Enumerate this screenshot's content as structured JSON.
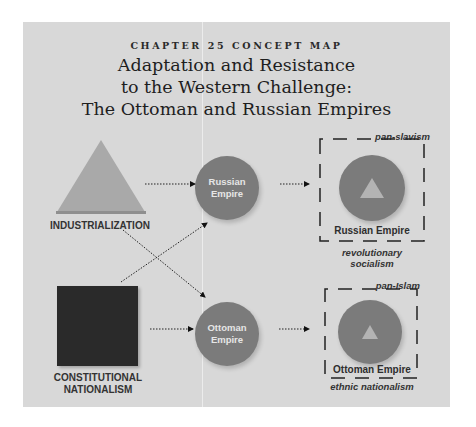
{
  "header": {
    "kicker": "CHAPTER 25 CONCEPT MAP",
    "title_lines": [
      "Adaptation and Resistance",
      "to the Western Challenge:",
      "The Ottoman and Russian Empires"
    ]
  },
  "sources": [
    {
      "id": "industrialization",
      "label": "INDUSTRIALIZATION",
      "shape": "triangle",
      "color": "#a9a9a9"
    },
    {
      "id": "constitutional-nationalism",
      "label_lines": [
        "CONSTITUTIONAL",
        "NATIONALISM"
      ],
      "shape": "square",
      "color": "#2a2a2a"
    }
  ],
  "empires": [
    {
      "id": "russian",
      "label_lines": [
        "Russian",
        "Empire"
      ],
      "color": "#7b7b7b"
    },
    {
      "id": "ottoman",
      "label_lines": [
        "Ottoman",
        "Empire"
      ],
      "color": "#7b7b7b"
    }
  ],
  "outcomes": [
    {
      "id": "russian-outcome",
      "top_label": "pan-slavism",
      "name": "Russian Empire",
      "bottom_label_lines": [
        "revolutionary",
        "socialism"
      ]
    },
    {
      "id": "ottoman-outcome",
      "top_label": "pan-Islam",
      "name": "Ottoman Empire",
      "bottom_label": "ethnic nationalism"
    }
  ],
  "connections": [
    {
      "from": "industrialization",
      "to": "russian",
      "style": "dotted-arrow"
    },
    {
      "from": "industrialization",
      "to": "ottoman",
      "style": "dotted-arrow"
    },
    {
      "from": "constitutional-nationalism",
      "to": "russian",
      "style": "dotted-arrow"
    },
    {
      "from": "constitutional-nationalism",
      "to": "ottoman",
      "style": "dotted-arrow"
    },
    {
      "from": "russian",
      "to": "russian-outcome",
      "style": "dotted-arrow"
    },
    {
      "from": "ottoman",
      "to": "ottoman-outcome",
      "style": "dotted-arrow"
    }
  ],
  "colors": {
    "panel": "#d8d8d8",
    "text": "#2a2a2a",
    "circle": "#7b7b7b",
    "triangle": "#a9a9a9",
    "square": "#2a2a2a"
  }
}
